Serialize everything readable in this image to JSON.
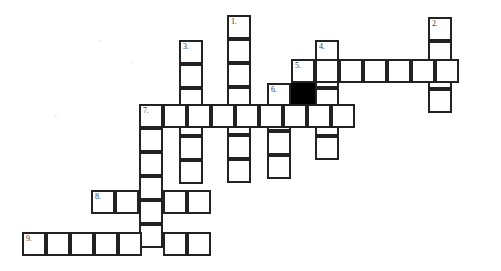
{
  "puzzle": {
    "type": "crossword-grid",
    "title": "Crossword puzzle grid",
    "canvas": {
      "width": 501,
      "height": 271
    },
    "cell_size": 24,
    "colors": {
      "background": "#ffffff",
      "cell_fill": "#ffffff",
      "cell_border": "#222222",
      "blocked_fill": "#000000",
      "number_text": "#3a3a3a"
    },
    "entries": [
      {
        "number": "1.",
        "direction": "down",
        "length": 7,
        "origin_x": 227,
        "origin_y": 15
      },
      {
        "number": "2.",
        "direction": "down",
        "length": 4,
        "origin_x": 428,
        "origin_y": 17
      },
      {
        "number": "3.",
        "direction": "down",
        "length": 6,
        "origin_x": 179,
        "origin_y": 40
      },
      {
        "number": "4.",
        "direction": "down",
        "length": 5,
        "origin_x": 315,
        "origin_y": 40
      },
      {
        "number": "5.",
        "direction": "across",
        "length": 7,
        "origin_x": 291,
        "origin_y": 59
      },
      {
        "number": "6.",
        "direction": "down",
        "length": 4,
        "origin_x": 267,
        "origin_y": 83
      },
      {
        "number": "7.",
        "direction": "across",
        "length": 9,
        "origin_x": 139,
        "origin_y": 104
      },
      {
        "number": "7b",
        "direction": "down",
        "length": 6,
        "origin_x": 139,
        "origin_y": 104
      },
      {
        "number": "8.",
        "direction": "across",
        "length": 5,
        "origin_x": 91,
        "origin_y": 190
      },
      {
        "number": "9.",
        "direction": "across",
        "length": 8,
        "origin_x": 22,
        "origin_y": 232
      }
    ],
    "cells": [
      {
        "x": 227,
        "y": 15,
        "blocked": false,
        "number": "1."
      },
      {
        "x": 227,
        "y": 39,
        "blocked": false,
        "number": ""
      },
      {
        "x": 227,
        "y": 63,
        "blocked": false,
        "number": ""
      },
      {
        "x": 227,
        "y": 87,
        "blocked": false,
        "number": ""
      },
      {
        "x": 227,
        "y": 111,
        "blocked": false,
        "number": ""
      },
      {
        "x": 227,
        "y": 135,
        "blocked": false,
        "number": ""
      },
      {
        "x": 227,
        "y": 159,
        "blocked": false,
        "number": ""
      },
      {
        "x": 428,
        "y": 17,
        "blocked": false,
        "number": "2."
      },
      {
        "x": 428,
        "y": 41,
        "blocked": false,
        "number": ""
      },
      {
        "x": 428,
        "y": 65,
        "blocked": false,
        "number": ""
      },
      {
        "x": 428,
        "y": 89,
        "blocked": false,
        "number": ""
      },
      {
        "x": 179,
        "y": 40,
        "blocked": false,
        "number": "3."
      },
      {
        "x": 179,
        "y": 64,
        "blocked": false,
        "number": ""
      },
      {
        "x": 179,
        "y": 88,
        "blocked": false,
        "number": ""
      },
      {
        "x": 179,
        "y": 112,
        "blocked": false,
        "number": ""
      },
      {
        "x": 179,
        "y": 136,
        "blocked": false,
        "number": ""
      },
      {
        "x": 179,
        "y": 160,
        "blocked": false,
        "number": ""
      },
      {
        "x": 315,
        "y": 40,
        "blocked": false,
        "number": "4."
      },
      {
        "x": 315,
        "y": 64,
        "blocked": false,
        "number": ""
      },
      {
        "x": 315,
        "y": 88,
        "blocked": false,
        "number": ""
      },
      {
        "x": 315,
        "y": 112,
        "blocked": false,
        "number": ""
      },
      {
        "x": 315,
        "y": 136,
        "blocked": false,
        "number": ""
      },
      {
        "x": 291,
        "y": 59,
        "blocked": false,
        "number": "5."
      },
      {
        "x": 315,
        "y": 59,
        "blocked": false,
        "number": ""
      },
      {
        "x": 339,
        "y": 59,
        "blocked": false,
        "number": ""
      },
      {
        "x": 363,
        "y": 59,
        "blocked": false,
        "number": ""
      },
      {
        "x": 387,
        "y": 59,
        "blocked": false,
        "number": ""
      },
      {
        "x": 411,
        "y": 59,
        "blocked": false,
        "number": ""
      },
      {
        "x": 435,
        "y": 59,
        "blocked": false,
        "number": ""
      },
      {
        "x": 267,
        "y": 83,
        "blocked": false,
        "number": "6."
      },
      {
        "x": 291,
        "y": 83,
        "blocked": true,
        "number": ""
      },
      {
        "x": 267,
        "y": 107,
        "blocked": false,
        "number": ""
      },
      {
        "x": 267,
        "y": 131,
        "blocked": false,
        "number": ""
      },
      {
        "x": 267,
        "y": 155,
        "blocked": false,
        "number": ""
      },
      {
        "x": 139,
        "y": 104,
        "blocked": false,
        "number": "7."
      },
      {
        "x": 163,
        "y": 104,
        "blocked": false,
        "number": ""
      },
      {
        "x": 187,
        "y": 104,
        "blocked": false,
        "number": ""
      },
      {
        "x": 211,
        "y": 104,
        "blocked": false,
        "number": ""
      },
      {
        "x": 235,
        "y": 104,
        "blocked": false,
        "number": ""
      },
      {
        "x": 259,
        "y": 104,
        "blocked": false,
        "number": ""
      },
      {
        "x": 283,
        "y": 104,
        "blocked": false,
        "number": ""
      },
      {
        "x": 307,
        "y": 104,
        "blocked": false,
        "number": ""
      },
      {
        "x": 331,
        "y": 104,
        "blocked": false,
        "number": ""
      },
      {
        "x": 139,
        "y": 128,
        "blocked": false,
        "number": ""
      },
      {
        "x": 139,
        "y": 152,
        "blocked": false,
        "number": ""
      },
      {
        "x": 139,
        "y": 176,
        "blocked": false,
        "number": ""
      },
      {
        "x": 139,
        "y": 200,
        "blocked": false,
        "number": ""
      },
      {
        "x": 139,
        "y": 224,
        "blocked": false,
        "number": ""
      },
      {
        "x": 91,
        "y": 190,
        "blocked": false,
        "number": "8."
      },
      {
        "x": 115,
        "y": 190,
        "blocked": false,
        "number": ""
      },
      {
        "x": 163,
        "y": 190,
        "blocked": false,
        "number": ""
      },
      {
        "x": 187,
        "y": 190,
        "blocked": false,
        "number": ""
      },
      {
        "x": 22,
        "y": 232,
        "blocked": false,
        "number": "9."
      },
      {
        "x": 46,
        "y": 232,
        "blocked": false,
        "number": ""
      },
      {
        "x": 70,
        "y": 232,
        "blocked": false,
        "number": ""
      },
      {
        "x": 94,
        "y": 232,
        "blocked": false,
        "number": ""
      },
      {
        "x": 118,
        "y": 232,
        "blocked": false,
        "number": ""
      },
      {
        "x": 163,
        "y": 232,
        "blocked": false,
        "number": ""
      },
      {
        "x": 187,
        "y": 232,
        "blocked": false,
        "number": ""
      }
    ]
  }
}
